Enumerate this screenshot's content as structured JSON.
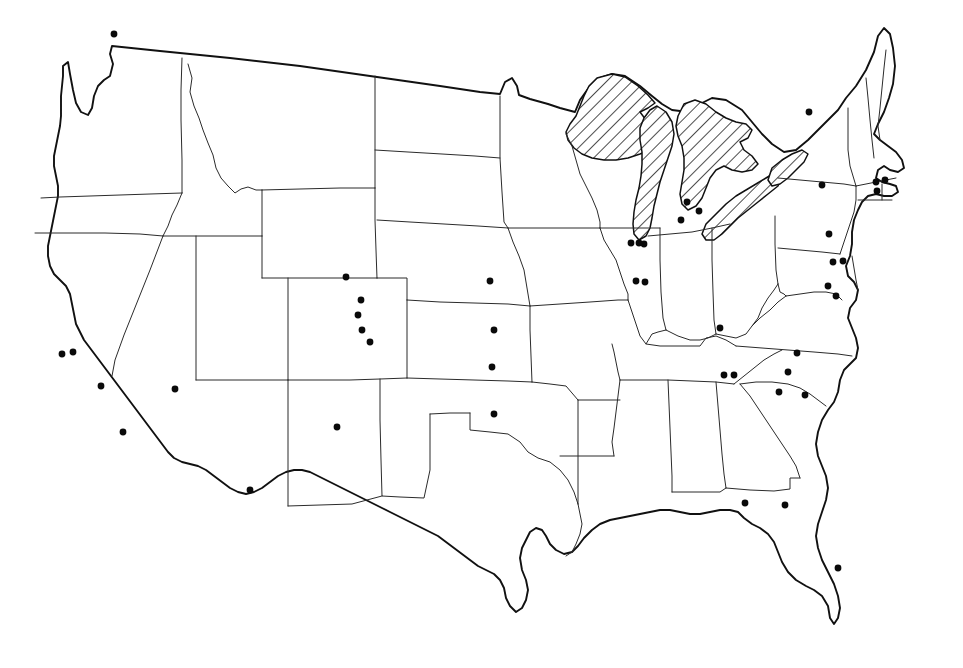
{
  "figure": {
    "kind": "dot-distribution-map",
    "region": "Contiguous United States",
    "background_color": "#ffffff",
    "outline_color": "#111111",
    "state_border_color": "#2b2b2b",
    "dot_color": "#0a0a0a",
    "dot_radius_px": 3.4,
    "hatch_color": "#111111",
    "caption": "",
    "title": "",
    "legend": "",
    "width": 963,
    "height": 668
  },
  "hatched_features": {
    "name": "Great Lakes",
    "fill_style": "diagonal-hatch",
    "members": [
      "Lake Superior",
      "Lake Michigan",
      "Lake Huron",
      "Lake Erie",
      "Lake Ontario"
    ]
  },
  "chart_data": {
    "type": "scatter",
    "title": "",
    "xlabel": "",
    "ylabel": "",
    "projection": "conic-usa-outline",
    "marker": "filled-circle",
    "point_count": 45,
    "points": [
      {
        "id": 1,
        "x": 114,
        "y": 34,
        "area": "Washington - Puget Sound"
      },
      {
        "id": 2,
        "x": 62,
        "y": 354,
        "area": "California - Bay Area west"
      },
      {
        "id": 3,
        "x": 73,
        "y": 352,
        "area": "California - Bay Area east"
      },
      {
        "id": 4,
        "x": 101,
        "y": 386,
        "area": "California - central coast"
      },
      {
        "id": 5,
        "x": 123,
        "y": 432,
        "area": "California - southern"
      },
      {
        "id": 6,
        "x": 175,
        "y": 389,
        "area": "Nevada - southern"
      },
      {
        "id": 7,
        "x": 250,
        "y": 490,
        "area": "Arizona - southeast"
      },
      {
        "id": 8,
        "x": 337,
        "y": 427,
        "area": "New Mexico - central"
      },
      {
        "id": 9,
        "x": 346,
        "y": 277,
        "area": "Wyoming - southeast"
      },
      {
        "id": 10,
        "x": 361,
        "y": 300,
        "area": "Colorado - north Front Range"
      },
      {
        "id": 11,
        "x": 358,
        "y": 315,
        "area": "Colorado - Denver"
      },
      {
        "id": 12,
        "x": 362,
        "y": 330,
        "area": "Colorado - central Front Range"
      },
      {
        "id": 13,
        "x": 370,
        "y": 342,
        "area": "Colorado - south Front Range"
      },
      {
        "id": 14,
        "x": 490,
        "y": 281,
        "area": "Nebraska - eastern"
      },
      {
        "id": 15,
        "x": 494,
        "y": 330,
        "area": "Kansas - eastern"
      },
      {
        "id": 16,
        "x": 492,
        "y": 367,
        "area": "Kansas - southeast"
      },
      {
        "id": 17,
        "x": 494,
        "y": 414,
        "area": "Oklahoma - central"
      },
      {
        "id": 18,
        "x": 631,
        "y": 243,
        "area": "Illinois - Chicago west"
      },
      {
        "id": 19,
        "x": 639,
        "y": 243,
        "area": "Illinois - Chicago"
      },
      {
        "id": 20,
        "x": 644,
        "y": 244,
        "area": "Illinois - Chicago east"
      },
      {
        "id": 21,
        "x": 636,
        "y": 281,
        "area": "Illinois - central west"
      },
      {
        "id": 22,
        "x": 645,
        "y": 282,
        "area": "Illinois - central east"
      },
      {
        "id": 23,
        "x": 687,
        "y": 202,
        "area": "Michigan - Lansing west"
      },
      {
        "id": 24,
        "x": 699,
        "y": 211,
        "area": "Michigan - Detroit"
      },
      {
        "id": 25,
        "x": 681,
        "y": 220,
        "area": "Michigan - southwest"
      },
      {
        "id": 26,
        "x": 720,
        "y": 328,
        "area": "Kentucky - central"
      },
      {
        "id": 27,
        "x": 809,
        "y": 112,
        "area": "New York - northern"
      },
      {
        "id": 28,
        "x": 822,
        "y": 185,
        "area": "New York - central"
      },
      {
        "id": 29,
        "x": 876,
        "y": 182,
        "area": "Massachusetts - Boston"
      },
      {
        "id": 30,
        "x": 885,
        "y": 180,
        "area": "Massachusetts - Boston east"
      },
      {
        "id": 31,
        "x": 877,
        "y": 191,
        "area": "Rhode Island / south coast"
      },
      {
        "id": 32,
        "x": 829,
        "y": 234,
        "area": "Pennsylvania - southeast"
      },
      {
        "id": 33,
        "x": 833,
        "y": 262,
        "area": "Maryland - Baltimore west"
      },
      {
        "id": 34,
        "x": 843,
        "y": 261,
        "area": "Maryland - Baltimore"
      },
      {
        "id": 35,
        "x": 828,
        "y": 286,
        "area": "Virginia - northern"
      },
      {
        "id": 36,
        "x": 836,
        "y": 296,
        "area": "Virginia - central"
      },
      {
        "id": 37,
        "x": 797,
        "y": 353,
        "area": "North Carolina - Triangle"
      },
      {
        "id": 38,
        "x": 788,
        "y": 372,
        "area": "North Carolina - Piedmont"
      },
      {
        "id": 39,
        "x": 724,
        "y": 375,
        "area": "Tennessee - east west"
      },
      {
        "id": 40,
        "x": 734,
        "y": 375,
        "area": "Tennessee - east"
      },
      {
        "id": 41,
        "x": 779,
        "y": 392,
        "area": "South Carolina - upstate"
      },
      {
        "id": 42,
        "x": 805,
        "y": 395,
        "area": "North Carolina - south"
      },
      {
        "id": 43,
        "x": 745,
        "y": 503,
        "area": "Florida - panhandle west"
      },
      {
        "id": 44,
        "x": 785,
        "y": 505,
        "area": "Florida - panhandle east"
      },
      {
        "id": 45,
        "x": 838,
        "y": 568,
        "area": "Florida - central peninsula"
      }
    ]
  }
}
